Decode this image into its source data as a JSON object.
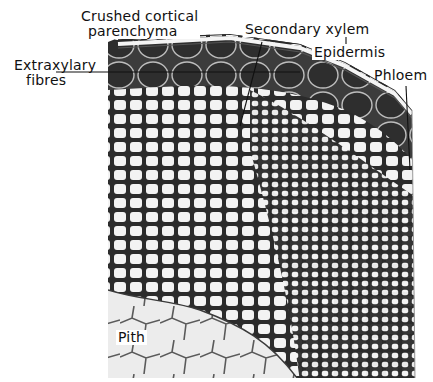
{
  "figure": {
    "labels": [
      {
        "id": "crushed-cortical-parenchyma",
        "text_line1": "Crushed cortical",
        "text_line2": "parenchyma"
      },
      {
        "id": "extraxylary-fibres",
        "text_line1": "Extraxylary",
        "text_line2": "fibres"
      },
      {
        "id": "secondary-xylem",
        "text": "Secondary xylem"
      },
      {
        "id": "epidermis",
        "text": "Epidermis"
      },
      {
        "id": "phloem",
        "text": "Phloem"
      },
      {
        "id": "pith",
        "text": "Pith"
      }
    ],
    "colors": {
      "background": "#ffffff",
      "cell_wall": "#2a2a2a",
      "cell_lumen": "#f2f2f2",
      "fibre_band": "#3a3a3a",
      "label_text": "#111111"
    }
  }
}
